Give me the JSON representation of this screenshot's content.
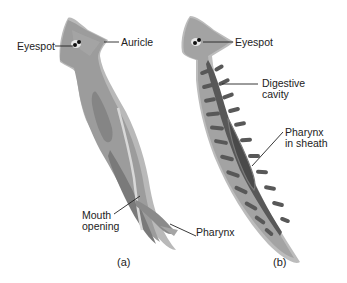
{
  "figure": {
    "panels": [
      {
        "id": "a",
        "caption": "(a)",
        "labels": {
          "eyespot": "Eyespot",
          "auricle": "Auricle",
          "mouth_line1": "Mouth",
          "mouth_line2": "opening",
          "pharynx": "Pharynx"
        }
      },
      {
        "id": "b",
        "caption": "(b)",
        "labels": {
          "eyespot": "Eyespot",
          "digestive_line1": "Digestive",
          "digestive_line2": "cavity",
          "pharynx_line1": "Pharynx",
          "pharynx_line2": "in sheath"
        }
      }
    ],
    "colors": {
      "body_outer": "#b5b5b5",
      "body_mid": "#9a9a9a",
      "body_dark": "#6e6e6e",
      "gut": "#555555",
      "eye": "#111111",
      "text": "#222222"
    }
  }
}
